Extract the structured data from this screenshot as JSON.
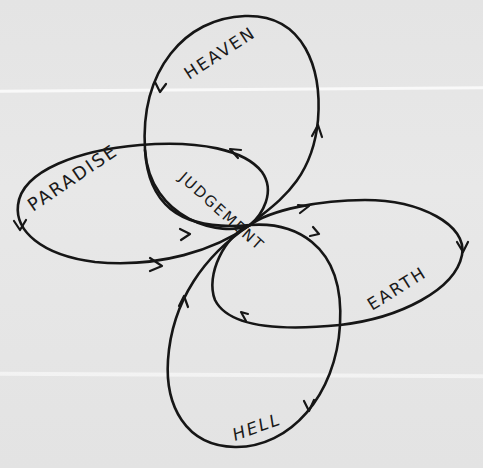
{
  "diagram": {
    "type": "cyclic loop diagram",
    "center_node": "JUDGEMENT",
    "loops": [
      {
        "id": "heaven",
        "label": "HEAVEN",
        "position": "top"
      },
      {
        "id": "paradise",
        "label": "PARADISE",
        "position": "left"
      },
      {
        "id": "earth",
        "label": "EARTH",
        "position": "right"
      },
      {
        "id": "hell",
        "label": "HELL",
        "position": "bottom"
      }
    ],
    "labels": {
      "heaven": "HEAVEN",
      "paradise": "PARADISE",
      "judgement": "JUDGEMENT",
      "earth": "EARTH",
      "hell": "HELL"
    },
    "colors": {
      "ink": "#161616",
      "paper": "#e6e6e6"
    }
  }
}
